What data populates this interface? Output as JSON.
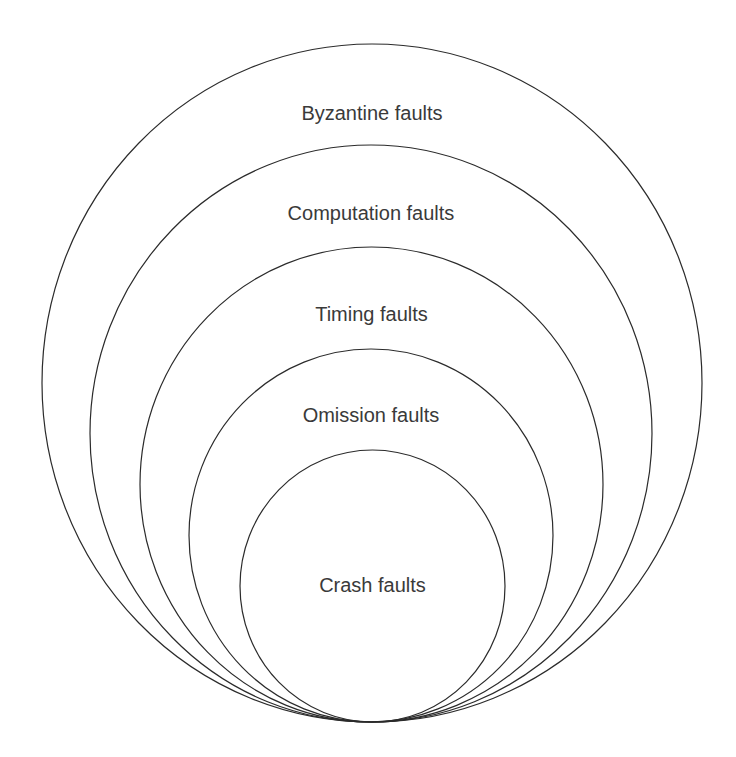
{
  "diagram": {
    "type": "nested-ellipses",
    "stroke_color": "#2b2b2b",
    "text_color": "#3a3a3a",
    "background": "#ffffff",
    "layers": [
      {
        "label": "Byzantine faults",
        "cx": 372,
        "cy": 383,
        "rx": 330,
        "ry": 339,
        "label_y": 120
      },
      {
        "label": "Computation faults",
        "cx": 371,
        "cy": 433.5,
        "rx": 281,
        "ry": 288.5,
        "label_y": 220
      },
      {
        "label": "Timing faults",
        "cx": 371.5,
        "cy": 484.5,
        "rx": 231.5,
        "ry": 237.5,
        "label_y": 321
      },
      {
        "label": "Omission faults",
        "cx": 371,
        "cy": 535.5,
        "rx": 182,
        "ry": 186.5,
        "label_y": 422
      },
      {
        "label": "Crash faults",
        "cx": 372.5,
        "cy": 586,
        "rx": 132.5,
        "ry": 136,
        "label_y": 592
      }
    ]
  }
}
